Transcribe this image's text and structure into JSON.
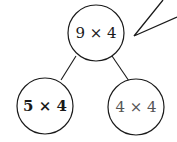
{
  "diagram": {
    "type": "tree",
    "root": {
      "label": "9 × 4"
    },
    "children": [
      {
        "label": "5 × 4",
        "style": "bold"
      },
      {
        "label": "4 × 4",
        "style": "grey"
      }
    ],
    "callout": {
      "shape": "speech-bubble-tail"
    },
    "colors": {
      "stroke": "#1a1a1a",
      "background": "#ffffff",
      "muted_text": "#555555"
    }
  }
}
